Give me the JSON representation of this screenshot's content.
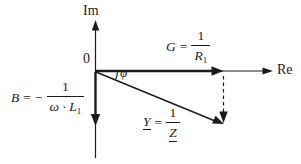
{
  "diagram": {
    "title_semantic": "admittance-phasor-diagram",
    "background_color": "#ffffff",
    "ink_color": "#1b1b1b",
    "axes": {
      "imaginary_label": "Im",
      "real_label": "Re",
      "origin_label": "0"
    },
    "angle": {
      "symbol": "φ"
    },
    "formulas": {
      "conductance": {
        "variable": "G",
        "equals": "=",
        "numerator": "1",
        "denominator_base": "R",
        "denominator_subscript": "1"
      },
      "susceptance": {
        "variable": "B",
        "equals": "=",
        "minus_sign": "−",
        "numerator": "1",
        "denominator_base": "ω · L",
        "denominator_subscript": "1"
      },
      "admittance": {
        "variable": "Y",
        "equals": "=",
        "numerator": "1",
        "denominator": "Z"
      }
    }
  }
}
